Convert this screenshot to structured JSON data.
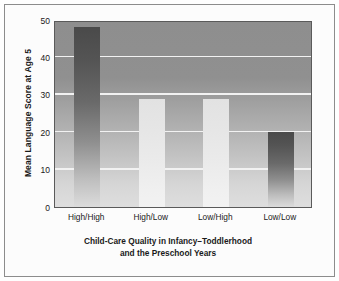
{
  "chart_data": {
    "type": "bar",
    "title": "",
    "categories": [
      "High/High",
      "High/Low",
      "Low/High",
      "Low/Low"
    ],
    "values": [
      48,
      29,
      29,
      20
    ],
    "series": [
      {
        "name": "Mean Language Score at Age 5",
        "values": [
          48,
          29,
          29,
          20
        ]
      }
    ],
    "xlabel_line1": "Child-Care Quality in Infancy–Toddlerhood",
    "xlabel_line2": "and the Preschool Years",
    "ylabel": "Mean Language Score at Age 5",
    "ylim": [
      0,
      50
    ],
    "yticks": [
      0,
      10,
      20,
      30,
      40,
      50
    ],
    "ytick_labels": [
      "0",
      "10",
      "20",
      "30",
      "40",
      "50"
    ],
    "grid": true,
    "gridlines_at": [
      10,
      20,
      30,
      40
    ],
    "legend": "none",
    "bar_styles": [
      "dark",
      "light",
      "light",
      "dark"
    ],
    "colors": {
      "bar_dark_top": "#4a4a4a",
      "bar_dark_bottom": "#dcdcdc",
      "bar_light_top": "#e2e2e2",
      "bar_light_bottom": "#f2f2f2",
      "plot_background_top": "#8e8e8e",
      "plot_background_bottom": "#dedede",
      "gridline": "#f2f2f2",
      "axis_border": "#5a5a5a",
      "frame_border": "#8c8c8c",
      "text": "#1a1a1a",
      "page_background": "#ffffff"
    }
  }
}
